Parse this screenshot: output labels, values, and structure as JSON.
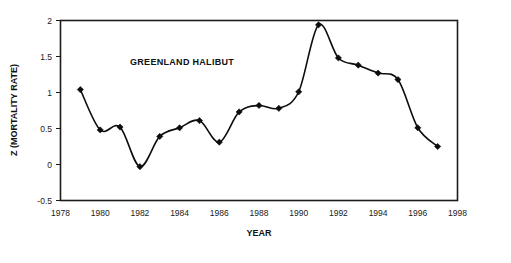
{
  "chart_data": {
    "type": "line",
    "title": "",
    "annotation": "GREENLAND HALIBUT",
    "xlabel": "YEAR",
    "ylabel": "Z (MORTALITY RATE)",
    "xlim": [
      1978,
      1998
    ],
    "ylim": [
      -0.5,
      2
    ],
    "grid": false,
    "legend": "none",
    "marker": "diamond",
    "line_color": "#0d0d0d",
    "marker_color": "#0d0d0d",
    "xticks": [
      1978,
      1980,
      1982,
      1984,
      1986,
      1988,
      1990,
      1992,
      1994,
      1996,
      1998
    ],
    "xtick_labels": [
      "1978",
      "1980",
      "1982",
      "1984",
      "1986",
      "1988",
      "1990",
      "1992",
      "1994",
      "1996",
      "1998"
    ],
    "yticks": [
      -0.5,
      0,
      0.5,
      1,
      1.5,
      2
    ],
    "ytick_labels": [
      "-0.5",
      "0",
      "0.5",
      "1",
      "1.5",
      "2"
    ],
    "x": [
      1979,
      1980,
      1981,
      1982,
      1983,
      1984,
      1985,
      1986,
      1987,
      1988,
      1989,
      1990,
      1991,
      1992,
      1993,
      1994,
      1995,
      1996,
      1997
    ],
    "values": [
      1.04,
      0.48,
      0.52,
      -0.03,
      0.39,
      0.51,
      0.61,
      0.31,
      0.73,
      0.82,
      0.78,
      1.01,
      1.94,
      1.48,
      1.38,
      1.27,
      1.18,
      0.51,
      0.25
    ],
    "series": [
      {
        "name": "Greenland halibut mortality",
        "values": [
          1.04,
          0.48,
          0.52,
          -0.03,
          0.39,
          0.51,
          0.61,
          0.31,
          0.73,
          0.82,
          0.78,
          1.01,
          1.94,
          1.48,
          1.38,
          1.27,
          1.18,
          0.51,
          0.25
        ]
      }
    ]
  }
}
